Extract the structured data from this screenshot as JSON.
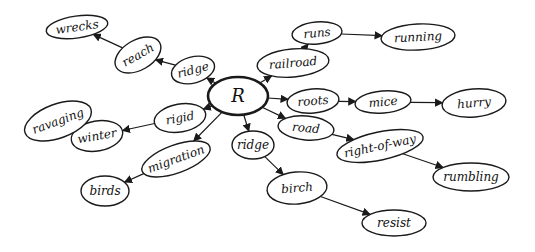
{
  "diagram": {
    "type": "hand-drawn concept map",
    "center": {
      "id": "R",
      "label": "R",
      "x": 238,
      "y": 96,
      "rx": 30,
      "ry": 19
    },
    "nodes": [
      {
        "id": "ridge1",
        "label": "ridge",
        "x": 193,
        "y": 70,
        "rx": 22,
        "ry": 13,
        "rot": -15
      },
      {
        "id": "reach",
        "label": "reach",
        "x": 138,
        "y": 55,
        "rx": 25,
        "ry": 15,
        "rot": -30
      },
      {
        "id": "wrecks",
        "label": "wrecks",
        "x": 77,
        "y": 27,
        "rx": 31,
        "ry": 11,
        "rot": -8
      },
      {
        "id": "railroad",
        "label": "railroad",
        "x": 293,
        "y": 63,
        "rx": 36,
        "ry": 14,
        "rot": -5
      },
      {
        "id": "runs",
        "label": "runs",
        "x": 317,
        "y": 33,
        "rx": 25,
        "ry": 11,
        "rot": -5
      },
      {
        "id": "running",
        "label": "running",
        "x": 418,
        "y": 37,
        "rx": 37,
        "ry": 13,
        "rot": -3
      },
      {
        "id": "roots",
        "label": "roots",
        "x": 313,
        "y": 101,
        "rx": 26,
        "ry": 12,
        "rot": -5
      },
      {
        "id": "mice",
        "label": "mice",
        "x": 383,
        "y": 102,
        "rx": 28,
        "ry": 11,
        "rot": -5
      },
      {
        "id": "hurry",
        "label": "hurry",
        "x": 474,
        "y": 103,
        "rx": 32,
        "ry": 14,
        "rot": -5
      },
      {
        "id": "road",
        "label": "road",
        "x": 306,
        "y": 128,
        "rx": 28,
        "ry": 12,
        "rot": 5
      },
      {
        "id": "right_of_way",
        "label": "right-of-way",
        "x": 380,
        "y": 146,
        "rx": 44,
        "ry": 14,
        "rot": -12
      },
      {
        "id": "rumbling",
        "label": "rumbling",
        "x": 471,
        "y": 177,
        "rx": 38,
        "ry": 14,
        "rot": 0
      },
      {
        "id": "ridge2",
        "label": "ridge",
        "x": 253,
        "y": 145,
        "rx": 21,
        "ry": 14,
        "rot": 0
      },
      {
        "id": "birch",
        "label": "birch",
        "x": 297,
        "y": 188,
        "rx": 30,
        "ry": 16,
        "rot": -5
      },
      {
        "id": "resist",
        "label": "resist",
        "x": 394,
        "y": 223,
        "rx": 32,
        "ry": 13,
        "rot": 0
      },
      {
        "id": "rigid",
        "label": "rigid",
        "x": 180,
        "y": 118,
        "rx": 26,
        "ry": 14,
        "rot": -10
      },
      {
        "id": "winter",
        "label": "winter",
        "x": 97,
        "y": 136,
        "rx": 26,
        "ry": 15,
        "rot": -10
      },
      {
        "id": "ravaging",
        "label": "ravaging",
        "x": 58,
        "y": 121,
        "rx": 35,
        "ry": 17,
        "rot": -20
      },
      {
        "id": "migration",
        "label": "migration",
        "x": 176,
        "y": 159,
        "rx": 36,
        "ry": 14,
        "rot": -20
      },
      {
        "id": "birds",
        "label": "birds",
        "x": 105,
        "y": 191,
        "rx": 24,
        "ry": 15,
        "rot": 0
      }
    ],
    "edges": [
      {
        "from": "R",
        "to": "ridge1"
      },
      {
        "from": "ridge1",
        "to": "reach"
      },
      {
        "from": "reach",
        "to": "wrecks"
      },
      {
        "from": "R",
        "to": "railroad"
      },
      {
        "from": "railroad",
        "to": "runs"
      },
      {
        "from": "runs",
        "to": "running"
      },
      {
        "from": "R",
        "to": "roots"
      },
      {
        "from": "roots",
        "to": "mice"
      },
      {
        "from": "mice",
        "to": "hurry"
      },
      {
        "from": "R",
        "to": "road"
      },
      {
        "from": "road",
        "to": "right_of_way"
      },
      {
        "from": "right_of_way",
        "to": "rumbling"
      },
      {
        "from": "R",
        "to": "ridge2"
      },
      {
        "from": "ridge2",
        "to": "birch"
      },
      {
        "from": "birch",
        "to": "resist"
      },
      {
        "from": "R",
        "to": "rigid"
      },
      {
        "from": "rigid",
        "to": "winter"
      },
      {
        "from": "winter",
        "to": "ravaging"
      },
      {
        "from": "R",
        "to": "migration"
      },
      {
        "from": "migration",
        "to": "birds"
      }
    ]
  },
  "colors": {
    "ink": "#1a1a1a",
    "background": "#ffffff"
  }
}
